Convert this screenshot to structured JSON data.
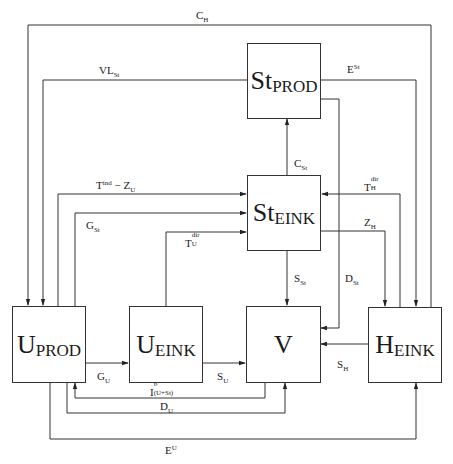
{
  "diagram": {
    "title": "",
    "nodes": {
      "st_prod": {
        "main": "St",
        "sub": "PROD"
      },
      "st_eink": {
        "main": "St",
        "sub": "EINK"
      },
      "u_prod": {
        "main": "U",
        "sub": "PROD"
      },
      "u_eink": {
        "main": "U",
        "sub": "EINK"
      },
      "v": {
        "main": "V",
        "sub": ""
      },
      "h_eink": {
        "main": "H",
        "sub": "EINK"
      }
    },
    "edges": {
      "c_h": {
        "base": "C",
        "sub": "H",
        "from": "H_EINK",
        "to": "U_PROD"
      },
      "vl_st": {
        "base": "VL",
        "sub": "St",
        "from": "St_PROD",
        "to": "U_PROD"
      },
      "e_st": {
        "base": "E",
        "sup": "St",
        "from": "St_PROD",
        "to": "H_EINK"
      },
      "c_st": {
        "base": "C",
        "sub": "St",
        "from": "St_EINK",
        "to": "St_PROD"
      },
      "t_ind_z_u": {
        "base": "T",
        "sup": "ind",
        "rest": " − Z",
        "rest_sub": "U",
        "from": "U_PROD",
        "to": "St_EINK"
      },
      "g_st": {
        "base": "G",
        "sub": "St",
        "from": "U_PROD",
        "to": "St_EINK"
      },
      "t_u_dir": {
        "base": "T",
        "sup": "dir",
        "sub": "U",
        "from": "U_EINK",
        "to": "St_EINK"
      },
      "t_h_dir": {
        "base": "T",
        "sup": "dir",
        "sub": "H",
        "from": "H_EINK",
        "to": "St_EINK"
      },
      "z_h": {
        "base": "Z",
        "sub": "H",
        "from": "St_EINK",
        "to": "H_EINK"
      },
      "s_st": {
        "base": "S",
        "sub": "St",
        "from": "St_EINK",
        "to": "V"
      },
      "d_st": {
        "base": "D",
        "sub": "St",
        "from": "St_PROD",
        "to": "V"
      },
      "g_u": {
        "base": "G",
        "sub": "U",
        "from": "U_PROD",
        "to": "U_EINK"
      },
      "s_u": {
        "base": "S",
        "sub": "U",
        "from": "U_EINK",
        "to": "V"
      },
      "s_h": {
        "base": "S",
        "sub": "H",
        "from": "H_EINK",
        "to": "V"
      },
      "i_b": {
        "base": "I",
        "sup": "b",
        "sub": "(U+St)",
        "from": "V",
        "to": "U_PROD"
      },
      "d_u": {
        "base": "D",
        "sub": "U",
        "from": "U_PROD",
        "to": "V"
      },
      "e_u": {
        "base": "E",
        "sup": "U",
        "from": "U_PROD",
        "to": "H_EINK"
      }
    }
  }
}
